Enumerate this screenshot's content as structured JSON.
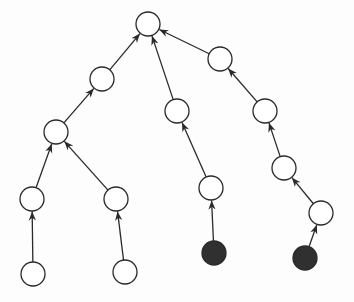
{
  "diagram": {
    "type": "tree",
    "colors": {
      "stroke": "#2a2a2a",
      "node_fill": "#ffffff",
      "highlight_fill": "#303030",
      "background": "#fdfdfd"
    },
    "node_radius": 12,
    "nodes": [
      {
        "id": "R",
        "x": 148,
        "y": 24,
        "filled": false
      },
      {
        "id": "A",
        "x": 102,
        "y": 79,
        "filled": false
      },
      {
        "id": "B",
        "x": 177,
        "y": 111,
        "filled": false
      },
      {
        "id": "C",
        "x": 220,
        "y": 59,
        "filled": false
      },
      {
        "id": "D",
        "x": 56,
        "y": 132,
        "filled": false
      },
      {
        "id": "E",
        "x": 32,
        "y": 199,
        "filled": false
      },
      {
        "id": "F",
        "x": 116,
        "y": 199,
        "filled": false
      },
      {
        "id": "G",
        "x": 33,
        "y": 274,
        "filled": false
      },
      {
        "id": "H",
        "x": 125,
        "y": 272,
        "filled": false
      },
      {
        "id": "I",
        "x": 211,
        "y": 188,
        "filled": false
      },
      {
        "id": "J",
        "x": 214,
        "y": 253,
        "filled": true
      },
      {
        "id": "K",
        "x": 265,
        "y": 111,
        "filled": false
      },
      {
        "id": "L",
        "x": 284,
        "y": 168,
        "filled": false
      },
      {
        "id": "M",
        "x": 321,
        "y": 213,
        "filled": false
      },
      {
        "id": "N",
        "x": 305,
        "y": 258,
        "filled": true
      }
    ],
    "edges": [
      {
        "from": "A",
        "to": "R"
      },
      {
        "from": "B",
        "to": "R"
      },
      {
        "from": "C",
        "to": "R"
      },
      {
        "from": "D",
        "to": "A"
      },
      {
        "from": "E",
        "to": "D"
      },
      {
        "from": "F",
        "to": "D"
      },
      {
        "from": "G",
        "to": "E"
      },
      {
        "from": "H",
        "to": "F"
      },
      {
        "from": "I",
        "to": "B"
      },
      {
        "from": "J",
        "to": "I"
      },
      {
        "from": "K",
        "to": "C"
      },
      {
        "from": "L",
        "to": "K"
      },
      {
        "from": "M",
        "to": "L"
      },
      {
        "from": "N",
        "to": "M"
      }
    ]
  }
}
